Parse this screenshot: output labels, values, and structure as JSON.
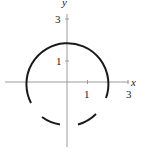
{
  "diagram": {
    "type": "circle-graph",
    "axes": {
      "x_label": "x",
      "y_label": "y",
      "x_ticks": [
        "1",
        "3"
      ],
      "y_ticks": [
        "1",
        "3"
      ]
    },
    "circle": {
      "center": [
        0,
        0
      ],
      "radius": 2
    },
    "colors": {
      "curve": "#1a1a1a",
      "axis": "#999999"
    }
  }
}
